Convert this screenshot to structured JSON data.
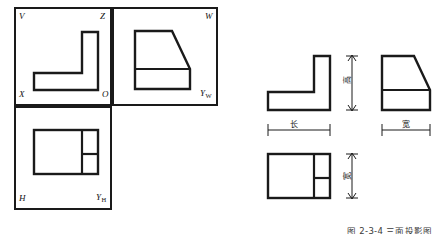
{
  "figure": {
    "caption": "图 2-3-4  三面投影图",
    "type": "orthographic-projection-drawing",
    "line_color": "#1a1a1a",
    "background_color": "#ffffff"
  },
  "projection_box": {
    "name": "three-plane-projection-system",
    "planes": [
      {
        "id": "V",
        "label": "V",
        "meaning": "frontal-plane"
      },
      {
        "id": "W",
        "label": "W",
        "meaning": "profile-plane"
      },
      {
        "id": "H",
        "label": "H",
        "meaning": "horizontal-plane"
      }
    ],
    "axis_labels": [
      {
        "id": "V",
        "text": "V"
      },
      {
        "id": "Z",
        "text": "Z"
      },
      {
        "id": "W",
        "text": "W"
      },
      {
        "id": "X",
        "text": "X"
      },
      {
        "id": "O",
        "text": "O"
      },
      {
        "id": "YW",
        "text": "Y",
        "sub": "W"
      },
      {
        "id": "H",
        "text": "H"
      },
      {
        "id": "YH",
        "text": "Y",
        "sub": "H"
      }
    ]
  },
  "flat_views": {
    "front_view": {
      "name": "front-view",
      "shape": "L-bracket"
    },
    "side_view": {
      "name": "side-view",
      "shape": "angled-rib"
    },
    "top_view": {
      "name": "top-view",
      "shape": "divided-rectangle"
    }
  },
  "dimensions": [
    {
      "id": "height",
      "text": "高",
      "orientation": "vertical",
      "view": "front-view"
    },
    {
      "id": "length",
      "text": "长",
      "orientation": "horizontal",
      "view": "front-view"
    },
    {
      "id": "width-side",
      "text": "宽",
      "orientation": "horizontal",
      "view": "side-view"
    },
    {
      "id": "width-top",
      "text": "宽",
      "orientation": "vertical",
      "view": "top-view"
    }
  ]
}
